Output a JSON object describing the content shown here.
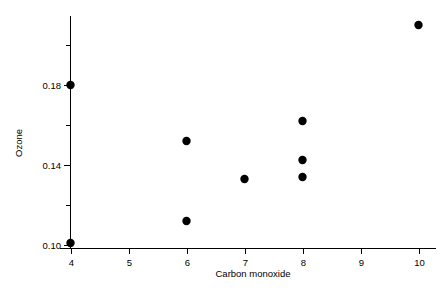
{
  "chart_data": {
    "type": "scatter",
    "title": "",
    "xlabel": "Carbon monoxide",
    "ylabel": "Ozone",
    "xlim": [
      3.6,
      10.6
    ],
    "ylim": [
      0.099,
      0.2155
    ],
    "grid": false,
    "legend": null,
    "x_ticks_major": [
      4,
      5,
      6,
      7,
      8,
      9,
      10
    ],
    "x_tick_labels": [
      "4",
      "5",
      "6",
      "7",
      "8",
      "9",
      "10"
    ],
    "y_ticks_major": [
      0.1,
      0.14,
      0.18
    ],
    "y_tick_labels": [
      "0.10",
      "0.14",
      "0.18"
    ],
    "y_ticks_minor": [
      0.12,
      0.16,
      0.2
    ],
    "marker": "filled-circle",
    "marker_color": "#000000",
    "marker_size": 4.2,
    "points": [
      {
        "x": 4,
        "y": 0.18
      },
      {
        "x": 4,
        "y": 0.101
      },
      {
        "x": 6,
        "y": 0.152
      },
      {
        "x": 6,
        "y": 0.112
      },
      {
        "x": 7,
        "y": 0.133
      },
      {
        "x": 8,
        "y": 0.162
      },
      {
        "x": 8,
        "y": 0.1425
      },
      {
        "x": 8,
        "y": 0.134
      },
      {
        "x": 10,
        "y": 0.21
      }
    ]
  },
  "figure": {
    "background_color": "#ffffff",
    "axis_color": "#000000"
  }
}
